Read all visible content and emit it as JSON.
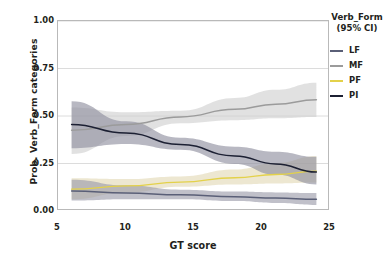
{
  "chart_data": {
    "type": "line",
    "title": "",
    "xlabel": "GT score",
    "ylabel": "Prob. Verb_Form categories",
    "xlim": [
      5,
      25
    ],
    "ylim": [
      0.0,
      1.0
    ],
    "xticks": [
      "5",
      "10",
      "15",
      "20",
      "25"
    ],
    "xtick_values": [
      5,
      10,
      15,
      20,
      25
    ],
    "yticks": [
      "0.00",
      "0.25",
      "0.50",
      "0.75",
      "1.00"
    ],
    "ytick_values": [
      0.0,
      0.25,
      0.5,
      0.75,
      1.0
    ],
    "grid": "horizontal",
    "legend_position": "right",
    "legend_title": "Verb_Form",
    "legend_subtitle": "(95% CI)",
    "x": [
      6,
      10,
      14,
      18,
      21,
      24
    ],
    "series": [
      {
        "name": "LF",
        "color": "#5a5f77",
        "band_color": "#9a9aa8",
        "values": [
          0.105,
          0.095,
          0.085,
          0.075,
          0.068,
          0.062
        ],
        "ci_lower": [
          0.055,
          0.062,
          0.062,
          0.052,
          0.042,
          0.032
        ],
        "ci_upper": [
          0.165,
          0.135,
          0.112,
          0.102,
          0.098,
          0.095
        ]
      },
      {
        "name": "MF",
        "color": "#9b9b9b",
        "band_color": "#cfcfcf",
        "values": [
          0.425,
          0.455,
          0.495,
          0.535,
          0.562,
          0.585
        ],
        "ci_lower": [
          0.3,
          0.395,
          0.462,
          0.478,
          0.488,
          0.495
        ],
        "ci_upper": [
          0.545,
          0.52,
          0.528,
          0.595,
          0.638,
          0.675
        ]
      },
      {
        "name": "PF",
        "color": "#e3d14a",
        "band_color": "#e2d9b4",
        "values": [
          0.115,
          0.132,
          0.152,
          0.175,
          0.192,
          0.21
        ],
        "ci_lower": [
          0.062,
          0.098,
          0.128,
          0.14,
          0.145,
          0.15
        ],
        "ci_upper": [
          0.172,
          0.168,
          0.182,
          0.218,
          0.252,
          0.288
        ]
      },
      {
        "name": "PI",
        "color": "#1c2033",
        "band_color": "#8d8d9c",
        "values": [
          0.455,
          0.41,
          0.35,
          0.29,
          0.248,
          0.205
        ],
        "ci_lower": [
          0.33,
          0.352,
          0.322,
          0.248,
          0.192,
          0.14
        ],
        "ci_upper": [
          0.578,
          0.472,
          0.385,
          0.338,
          0.312,
          0.285
        ]
      }
    ]
  },
  "axes": {
    "y_title": "Prob. Verb_Form categories",
    "x_title": "GT score"
  },
  "legend": {
    "title": "Verb_Form",
    "subtitle": "(95% CI)",
    "items": [
      {
        "label": "LF",
        "color": "#5a5f77"
      },
      {
        "label": "MF",
        "color": "#9b9b9b"
      },
      {
        "label": "PF",
        "color": "#e3d14a"
      },
      {
        "label": "PI",
        "color": "#1c2033"
      }
    ]
  }
}
